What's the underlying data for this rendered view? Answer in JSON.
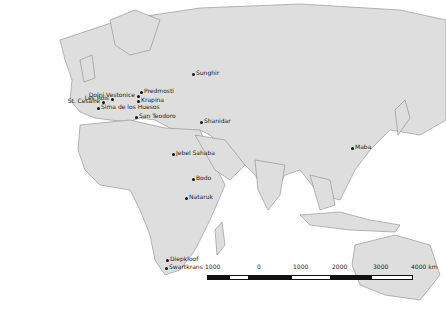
{
  "map": {
    "colors": {
      "land": "#dedede",
      "border": "#8a8a8a",
      "ocean": "#ffffff",
      "marker": "#111111"
    },
    "sites": [
      {
        "name": "Sunghir",
        "x": 193,
        "y": 74
      },
      {
        "name": "Predmosti",
        "x": 141,
        "y": 92
      },
      {
        "name": "Dolni Vestonice",
        "x": 138,
        "y": 96
      },
      {
        "name": "Les Rois",
        "x": 112,
        "y": 99
      },
      {
        "name": "St. Cesaire",
        "x": 103,
        "y": 102
      },
      {
        "name": "Krapina",
        "x": 138,
        "y": 101
      },
      {
        "name": "Sima de los Huesos",
        "x": 98,
        "y": 108
      },
      {
        "name": "San Teodoro",
        "x": 136,
        "y": 117
      },
      {
        "name": "Shanidar",
        "x": 201,
        "y": 122
      },
      {
        "name": "Maba",
        "x": 352,
        "y": 148
      },
      {
        "name": "Jebel Sahaba",
        "x": 173,
        "y": 154
      },
      {
        "name": "Bodo",
        "x": 193,
        "y": 179
      },
      {
        "name": "Nataruk",
        "x": 186,
        "y": 198
      },
      {
        "name": "Diepkloof",
        "x": 167,
        "y": 260
      },
      {
        "name": "Swartkrans",
        "x": 166,
        "y": 268
      }
    ],
    "scale_bar": {
      "labels": [
        "1000",
        "0",
        "1000",
        "2000",
        "3000",
        "4000 km"
      ]
    }
  }
}
